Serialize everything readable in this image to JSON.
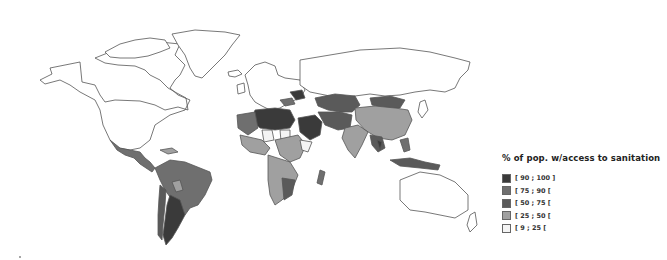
{
  "map": {
    "title": "% of pop. w/access to sanitation",
    "type": "choropleth-world",
    "legend": {
      "title": "% of pop. w/access to sanitation",
      "items": [
        {
          "label": "[ 90 ; 100 ]",
          "color": "#3a3a3a"
        },
        {
          "label": "[ 75 ; 90 [",
          "color": "#6f6f6f"
        },
        {
          "label": "[ 50 ; 75 [",
          "color": "#5a5a5a"
        },
        {
          "label": "[ 25 ; 50 [",
          "color": "#a0a0a0"
        },
        {
          "label": "[ 9 ; 25 [",
          "color": "#f4f4f4"
        }
      ]
    },
    "colors": {
      "no_data": "#ffffff",
      "border": "#555555",
      "c90": "#3a3a3a",
      "c75": "#6f6f6f",
      "c50": "#5a5a5a",
      "c25": "#a0a0a0",
      "c9": "#f4f4f4"
    }
  }
}
